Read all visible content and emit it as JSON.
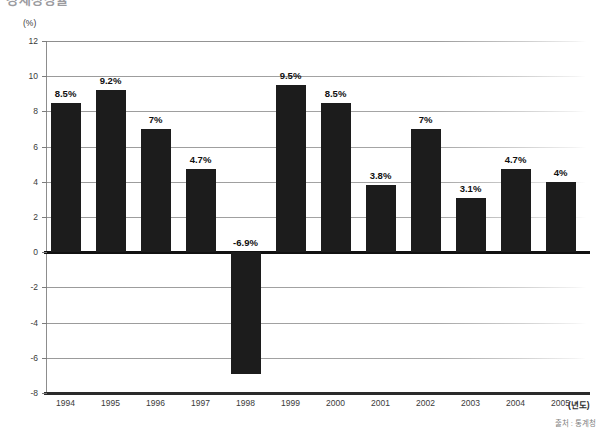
{
  "page": {
    "clipped_heading": "경제성장률"
  },
  "chart_data": {
    "type": "bar",
    "title": "",
    "subtitle": "",
    "xlabel": "(년도)",
    "ylabel": "(%)",
    "unit_label": "(%)",
    "categories": [
      "1994",
      "1995",
      "1996",
      "1997",
      "1998",
      "1999",
      "2000",
      "2001",
      "2002",
      "2003",
      "2004",
      "2005"
    ],
    "values": [
      8.5,
      9.2,
      7,
      4.7,
      -6.9,
      9.5,
      8.5,
      3.8,
      7,
      3.1,
      4.7,
      4
    ],
    "data_labels": [
      "8.5%",
      "9.2%",
      "7%",
      "4.7%",
      "-6.9%",
      "9.5%",
      "8.5%",
      "3.8%",
      "7%",
      "3.1%",
      "4.7%",
      "4%"
    ],
    "ylim": [
      -8,
      12
    ],
    "ytick_step": 2,
    "yticks": [
      12,
      10,
      8,
      6,
      4,
      2,
      0,
      -2,
      -4,
      -6,
      -8
    ],
    "ytick_labels": [
      "12",
      "10",
      "8",
      "6",
      "4",
      "2",
      "0",
      "-2",
      "-4",
      "-6",
      "-8"
    ],
    "grid": true,
    "legend": "none",
    "bar_color": "#1c1c1c",
    "gridline_color": "#a6a6a6",
    "zeroline_color": "#111111",
    "background_color": "#ffffff"
  },
  "footer": {
    "source": "출처 : 통계청"
  }
}
